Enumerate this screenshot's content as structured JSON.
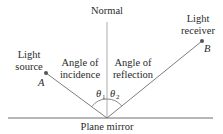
{
  "diagram": {
    "labels": {
      "normal": "Normal",
      "mirror": "Plane mirror",
      "source_line1": "Light",
      "source_line2": "source",
      "receiver_line1": "Light",
      "receiver_line2": "receiver",
      "incidence_line1": "Angle of",
      "incidence_line2": "incidence",
      "reflection_line1": "Angle of",
      "reflection_line2": "reflection",
      "point_a": "A",
      "point_b": "B",
      "theta1": "θ",
      "theta1_sub": "1",
      "theta2": "θ",
      "theta2_sub": "2"
    },
    "colors": {
      "line": "#6e6e6e",
      "text": "#2a2a2a",
      "point": "#555555"
    }
  }
}
